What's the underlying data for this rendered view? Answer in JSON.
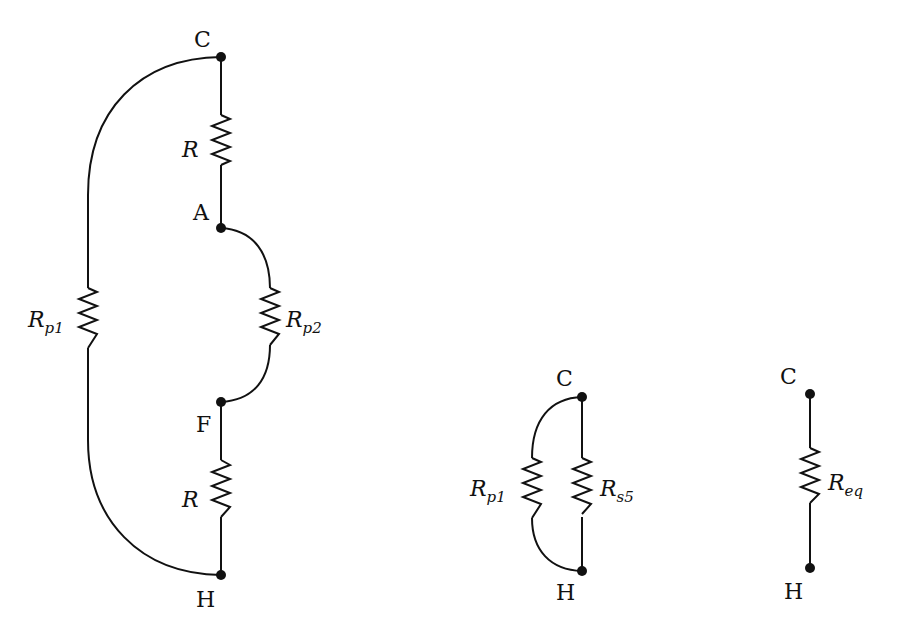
{
  "diagram": {
    "title": "",
    "circuits": [
      {
        "name": "original-reduced-circuit",
        "nodes": [
          "C",
          "A",
          "F",
          "H"
        ],
        "resistors": [
          {
            "label": "R",
            "sub": "",
            "between": [
              "C",
              "A"
            ]
          },
          {
            "label": "R",
            "sub": "p2",
            "between": [
              "A",
              "F"
            ]
          },
          {
            "label": "R",
            "sub": "",
            "between": [
              "F",
              "H"
            ]
          },
          {
            "label": "R",
            "sub": "p1",
            "between": [
              "C",
              "H"
            ]
          }
        ]
      },
      {
        "name": "parallel-circuit",
        "nodes": [
          "C",
          "H"
        ],
        "resistors": [
          {
            "label": "R",
            "sub": "p1",
            "between": [
              "C",
              "H"
            ]
          },
          {
            "label": "R",
            "sub": "s5",
            "between": [
              "C",
              "H"
            ]
          }
        ]
      },
      {
        "name": "equivalent-circuit",
        "nodes": [
          "C",
          "H"
        ],
        "resistors": [
          {
            "label": "R",
            "sub": "eq",
            "between": [
              "C",
              "H"
            ]
          }
        ]
      }
    ],
    "labels": {
      "c1": "C",
      "a1": "A",
      "f1": "F",
      "h1": "H",
      "r_top": "R",
      "r_bot": "R",
      "rp1_main": "R",
      "rp1_sub": "p1",
      "rp2_main": "R",
      "rp2_sub": "p2",
      "c2": "C",
      "h2": "H",
      "rp1b_main": "R",
      "rp1b_sub": "p1",
      "rs5_main": "R",
      "rs5_sub": "s5",
      "c3": "C",
      "h3": "H",
      "req_main": "R",
      "req_sub": "eq"
    }
  }
}
